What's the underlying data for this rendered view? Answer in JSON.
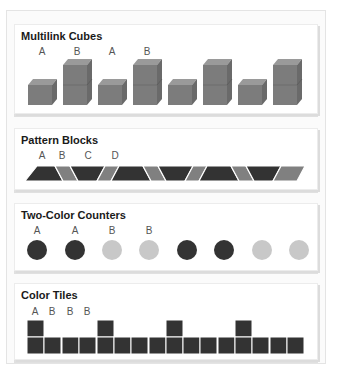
{
  "sections": [
    {
      "title": "Multilink Cubes",
      "labels": [
        "A",
        "B",
        "A",
        "B"
      ],
      "pattern": [
        "1-cube",
        "2-cube",
        "1-cube",
        "2-cube",
        "1-cube",
        "2-cube",
        "1-cube",
        "2-cube"
      ],
      "color": "#777777"
    },
    {
      "title": "Pattern Blocks",
      "labels": [
        "A",
        "B",
        "C",
        "D"
      ],
      "pattern": [
        "trapezoid-up",
        "rhombus-left",
        "trapezoid-down",
        "rhombus-right",
        "trapezoid-up",
        "rhombus-left",
        "trapezoid-down",
        "rhombus-right",
        "trapezoid-up",
        "rhombus-left",
        "trapezoid-down",
        "rhombus-right"
      ],
      "colors": {
        "trapezoid": "#333333",
        "rhombus": "#808080"
      }
    },
    {
      "title": "Two-Color Counters",
      "labels": [
        "A",
        "A",
        "B",
        "B"
      ],
      "pattern": [
        "dark",
        "dark",
        "light",
        "light",
        "dark",
        "dark",
        "light",
        "light"
      ],
      "colors": {
        "dark": "#333333",
        "light": "#c8c8c8"
      }
    },
    {
      "title": "Color Tiles",
      "labels": [
        "A",
        "B",
        "B",
        "B"
      ],
      "pattern": [
        "A",
        "B",
        "B",
        "B",
        "A",
        "B",
        "B",
        "B",
        "A",
        "B",
        "B",
        "B",
        "A",
        "B",
        "B",
        "B"
      ],
      "color": "#333333"
    }
  ]
}
